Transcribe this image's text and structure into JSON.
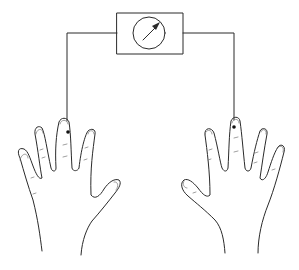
{
  "diagram": {
    "title": "",
    "components": [
      {
        "id": "meter",
        "type": "meter-dial-box",
        "icon": "gauge-icon"
      },
      {
        "id": "left-wire",
        "type": "wire",
        "connects": [
          "meter",
          "left-hand-middle-finger"
        ]
      },
      {
        "id": "right-wire",
        "type": "wire",
        "connects": [
          "meter",
          "right-hand-middle-finger"
        ]
      },
      {
        "id": "left-hand",
        "type": "hand",
        "side": "left",
        "electrode": "middle finger"
      },
      {
        "id": "right-hand",
        "type": "hand",
        "side": "right",
        "electrode": "middle finger"
      }
    ],
    "colors": {
      "line": "#2a2a2a",
      "background": "#ffffff"
    }
  }
}
